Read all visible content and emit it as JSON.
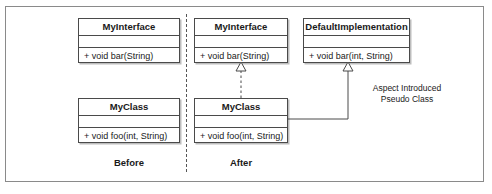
{
  "sections": {
    "before": {
      "caption": "Before",
      "classes": [
        {
          "name": "MyInterface",
          "attributes": [],
          "operations": [
            "+ void bar(String)"
          ]
        },
        {
          "name": "MyClass",
          "attributes": [],
          "operations": [
            "+ void foo(int, String)"
          ]
        }
      ]
    },
    "after": {
      "caption": "After",
      "classes": [
        {
          "name": "MyInterface",
          "attributes": [],
          "operations": [
            "+ void bar(String)"
          ]
        },
        {
          "name": "DefaultImplementation",
          "attributes": [],
          "operations": [
            "+ void bar(int, String)"
          ]
        },
        {
          "name": "MyClass",
          "attributes": [],
          "operations": [
            "+ void foo(int, String)"
          ]
        }
      ]
    }
  },
  "annotation": {
    "line1": "Aspect Introduced",
    "line2": "Pseudo Class"
  },
  "relationships": [
    {
      "name": "realization-myclass-myinterface",
      "style": "dashed",
      "arrowhead": "hollow-triangle",
      "from": "MyClass",
      "to": "MyInterface"
    },
    {
      "name": "generalization-myclass-defaultimplementation",
      "style": "solid",
      "arrowhead": "hollow-triangle",
      "from": "MyClass",
      "to": "DefaultImplementation"
    }
  ],
  "colors": {
    "line": "#4a4a4a",
    "frame": "#8a8a8a",
    "text": "#1a1a1a",
    "background": "#ffffff",
    "shadow": "#bdbdbd"
  }
}
